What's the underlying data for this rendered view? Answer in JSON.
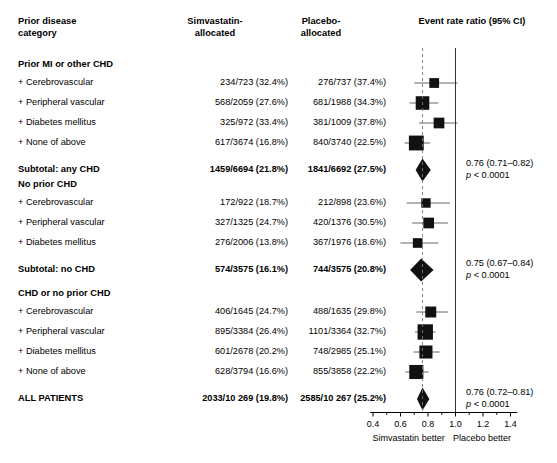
{
  "headers": {
    "col_category": "Prior disease\ncategory",
    "col_category_l1": "Prior disease",
    "col_category_l2": "category",
    "col_simva_l1": "Simvastatin-",
    "col_simva_l2": "allocated",
    "col_placebo_l1": "Placebo-",
    "col_placebo_l2": "allocated",
    "col_plot": "Event rate ratio (95% CI)"
  },
  "axis": {
    "ticks": [
      "0.4",
      "0.6",
      "0.8",
      "1.0",
      "1.2",
      "1.4"
    ],
    "tick_values": [
      0.4,
      0.6,
      0.8,
      1.0,
      1.2,
      1.4
    ],
    "left_label": "Simvastatin better",
    "right_label": "Placebo better",
    "null_value": 1.0,
    "reference_dashed": 0.76
  },
  "chart_data": {
    "type": "forest",
    "title": "Event rate ratio (95% CI)",
    "xlabel": "",
    "ylabel": "",
    "xlim": [
      0.4,
      1.45
    ],
    "xticks": [
      0.4,
      0.6,
      0.8,
      1.0,
      1.2,
      1.4
    ],
    "xscale": "linear",
    "grid": false,
    "null_line": 1.0,
    "dashed_reference_line": 0.76,
    "left_better_label": "Simvastatin better",
    "right_better_label": "Placebo better",
    "groups": [
      {
        "name": "Prior MI or other CHD",
        "rows": [
          {
            "label": "+ Cerebrovascular",
            "simva": "234/723 (32.4%)",
            "placebo": "276/737 (37.4%)",
            "rr": 0.845,
            "lcl": 0.7,
            "ucl": 1.015,
            "weight": 0.33,
            "type": "square"
          },
          {
            "label": "+ Peripheral vascular",
            "simva": "568/2059 (27.6%)",
            "placebo": "681/1988 (34.3%)",
            "rr": 0.76,
            "lcl": 0.665,
            "ucl": 0.875,
            "weight": 0.62,
            "type": "square"
          },
          {
            "label": "+ Diabetes mellitus",
            "simva": "325/972 (33.4%)",
            "placebo": "381/1009 (37.8%)",
            "rr": 0.88,
            "lcl": 0.735,
            "ucl": 1.015,
            "weight": 0.4,
            "type": "square"
          },
          {
            "label": "+ None of above",
            "simva": "617/3674 (16.8%)",
            "placebo": "840/3740 (22.5%)",
            "rr": 0.715,
            "lcl": 0.63,
            "ucl": 0.815,
            "weight": 0.72,
            "type": "square"
          }
        ],
        "summary": {
          "label": "Subtotal: any CHD",
          "simva": "1459/6694 (21.8%)",
          "placebo": "1841/6692 (27.5%)",
          "rr": 0.76,
          "lcl": 0.71,
          "ucl": 0.82,
          "type": "diamond",
          "ci_text": "0.76 (0.71–0.82)",
          "p_prefix": "p",
          "p_text": " < 0.0001"
        }
      },
      {
        "name": "No prior CHD",
        "rows": [
          {
            "label": "+ Cerebrovascular",
            "simva": "172/922 (18.7%)",
            "placebo": "212/898 (23.6%)",
            "rr": 0.785,
            "lcl": 0.645,
            "ucl": 0.96,
            "weight": 0.3,
            "type": "square"
          },
          {
            "label": "+ Peripheral vascular",
            "simva": "327/1325 (24.7%)",
            "placebo": "420/1376 (30.5%)",
            "rr": 0.805,
            "lcl": 0.685,
            "ucl": 0.945,
            "weight": 0.4,
            "type": "square"
          },
          {
            "label": "+ Diabetes mellitus",
            "simva": "276/2006 (13.8%)",
            "placebo": "367/1976 (18.6%)",
            "rr": 0.725,
            "lcl": 0.6,
            "ucl": 0.875,
            "weight": 0.32,
            "type": "square"
          }
        ],
        "summary": {
          "label": "Subtotal: no CHD",
          "simva": "574/3575 (16.1%)",
          "placebo": "744/3575 (20.8%)",
          "rr": 0.75,
          "lcl": 0.67,
          "ucl": 0.84,
          "type": "diamond",
          "ci_text": "0.75 (0.67–0.84)",
          "p_prefix": "p",
          "p_text": " < 0.0001"
        }
      },
      {
        "name": "CHD or no prior CHD",
        "rows": [
          {
            "label": "+ Cerebrovascular",
            "simva": "406/1645 (24.7%)",
            "placebo": "488/1635 (29.8%)",
            "rr": 0.82,
            "lcl": 0.715,
            "ucl": 0.945,
            "weight": 0.42,
            "type": "square"
          },
          {
            "label": "+ Peripheral vascular",
            "simva": "895/3384 (26.4%)",
            "placebo": "1101/3364 (32.7%)",
            "rr": 0.78,
            "lcl": 0.705,
            "ucl": 0.855,
            "weight": 0.76,
            "type": "square"
          },
          {
            "label": "+ Diabetes mellitus",
            "simva": "601/2678 (20.2%)",
            "placebo": "748/2985 (25.1%)",
            "rr": 0.785,
            "lcl": 0.695,
            "ucl": 0.885,
            "weight": 0.58,
            "type": "square"
          },
          {
            "label": "+ None of above",
            "simva": "628/3794 (16.6%)",
            "placebo": "855/3858 (22.2%)",
            "rr": 0.715,
            "lcl": 0.635,
            "ucl": 0.805,
            "weight": 0.66,
            "type": "square"
          }
        ],
        "summary": {
          "label": "ALL PATIENTS",
          "simva": "2033/10 269 (19.8%)",
          "placebo": "2585/10 267 (25.2%)",
          "rr": 0.76,
          "lcl": 0.72,
          "ucl": 0.81,
          "type": "diamond",
          "ci_text": "0.76 (0.72–0.81)",
          "p_prefix": "p",
          "p_text": " < 0.0001"
        }
      }
    ]
  }
}
